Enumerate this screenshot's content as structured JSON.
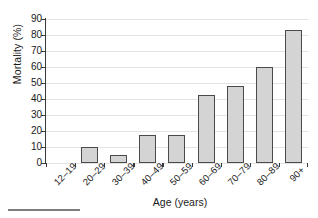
{
  "chart_data": {
    "type": "bar",
    "title": "",
    "xlabel": "Age (years)",
    "ylabel": "Mortality (%)",
    "categories": [
      "12–19",
      "20–29",
      "30–39",
      "40–49",
      "50–59",
      "60–69",
      "70–79",
      "80–89",
      "90+"
    ],
    "values": [
      0,
      10,
      5,
      17.5,
      17.5,
      42.5,
      48,
      60,
      83
    ],
    "ylim": [
      0,
      90
    ],
    "yticks": [
      0,
      10,
      20,
      30,
      40,
      50,
      60,
      70,
      80,
      90
    ],
    "ytick_labels": [
      "0",
      "10",
      "20",
      "30",
      "40",
      "50",
      "60",
      "70",
      "80",
      "90"
    ],
    "grid": true,
    "legend": false,
    "bar_fill_color": "#d4d4d4",
    "bar_edge_color": "#4a4a4a",
    "gridline_color": "#e3e3e3",
    "axis_color": "#3a3a3a"
  }
}
